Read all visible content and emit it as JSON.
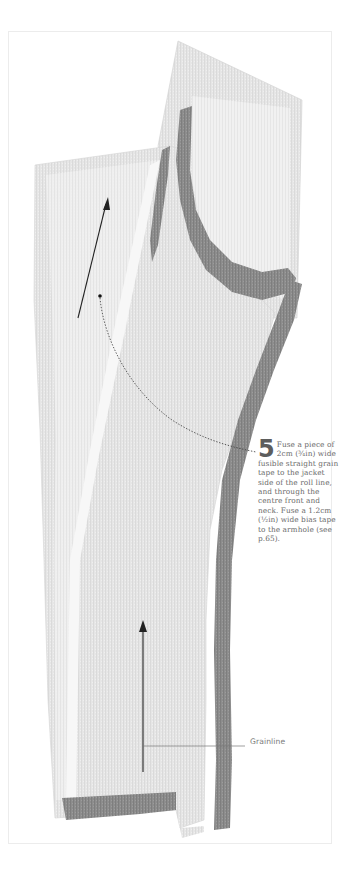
{
  "figure": {
    "step": {
      "number": "5",
      "text": "Fuse a piece of 2cm (¾in) wide fusible straight grain tape to the jacket side of the roll line, and through the centre front and neck. Fuse a 1.2cm (½in) wide bias tape to the armhole (see p.65)."
    },
    "callouts": {
      "grainline_label": "Grainline"
    },
    "colors": {
      "fabric_light": "#e9e9e9",
      "fabric_mid": "#d8d8d8",
      "tape_dark": "#8e8e8e",
      "text": "#6a6a6a",
      "frame_border": "#ececec"
    }
  }
}
